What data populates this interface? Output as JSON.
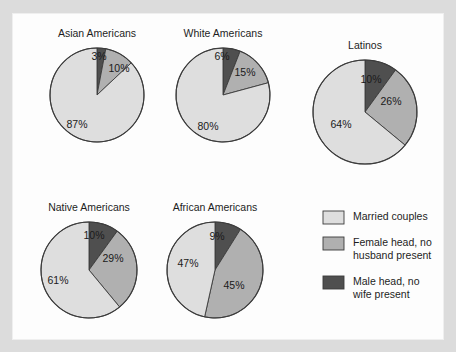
{
  "figure": {
    "background_color": "#dcdcdc",
    "panel_color": "#fdfdfd"
  },
  "chart_data": {
    "type": "pie",
    "title": "",
    "subtitle": "",
    "xlabel": "",
    "ylabel": "",
    "grid": false,
    "legend_position": "bottom-right",
    "value_unit": "%",
    "categories": [
      "Married couples",
      "Female head, no husband present",
      "Male head, no wife present"
    ],
    "colors": [
      "#dedede",
      "#b0b0b0",
      "#4f4f4f"
    ],
    "charts": [
      {
        "title": "Asian Americans",
        "labels": [
          "87%",
          "10%",
          "3%"
        ],
        "values": [
          87,
          10,
          3
        ],
        "cx": 85,
        "cy": 82,
        "r": 47,
        "label_positions": [
          [
            -20,
            30
          ],
          [
            22,
            -26
          ],
          [
            2,
            -38
          ]
        ]
      },
      {
        "title": "White Americans",
        "labels": [
          "80%",
          "15%",
          "6%"
        ],
        "values": [
          80,
          15,
          6
        ],
        "cx": 211,
        "cy": 82,
        "r": 47,
        "label_positions": [
          [
            -15,
            32
          ],
          [
            22,
            -22
          ],
          [
            -1,
            -38
          ]
        ]
      },
      {
        "title": "Latinos",
        "labels": [
          "64%",
          "26%",
          "10%"
        ],
        "values": [
          64,
          26,
          10
        ],
        "cx": 353,
        "cy": 99,
        "r": 52,
        "label_positions": [
          [
            -24,
            13
          ],
          [
            26,
            -10
          ],
          [
            6,
            -32
          ]
        ]
      },
      {
        "title": "Native Americans",
        "labels": [
          "61%",
          "29%",
          "10%"
        ],
        "values": [
          61,
          29,
          10
        ],
        "cx": 77,
        "cy": 257,
        "r": 48,
        "label_positions": [
          [
            -31,
            11
          ],
          [
            24,
            -11
          ],
          [
            5,
            -34
          ]
        ]
      },
      {
        "title": "African Americans",
        "labels": [
          "47%",
          "45%",
          "9%"
        ],
        "values": [
          47,
          45,
          9
        ],
        "cx": 203,
        "cy": 257,
        "r": 48,
        "label_positions": [
          [
            -27,
            -6
          ],
          [
            19,
            16
          ],
          [
            2,
            -33
          ]
        ]
      }
    ],
    "legend": {
      "x": 311,
      "y": 198,
      "items": [
        {
          "label_lines": [
            "Married couples"
          ],
          "color": "#dedede"
        },
        {
          "label_lines": [
            "Female head, no",
            "husband present"
          ],
          "color": "#b0b0b0"
        },
        {
          "label_lines": [
            "Male head, no",
            "wife present"
          ],
          "color": "#4f4f4f"
        }
      ]
    }
  }
}
